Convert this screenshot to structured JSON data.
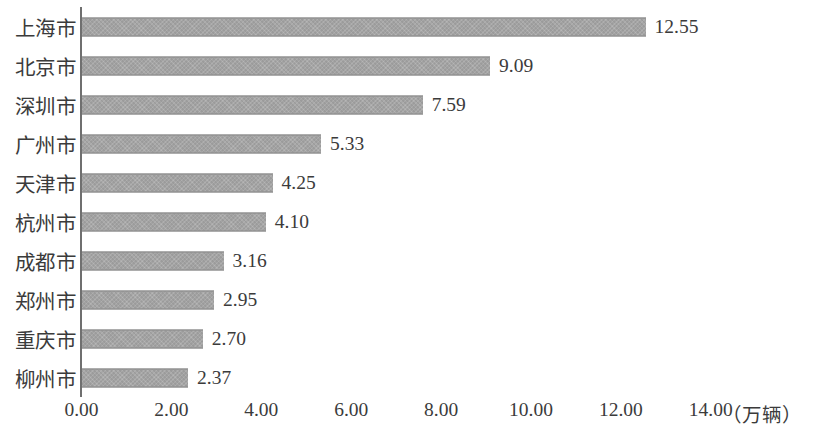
{
  "chart_data": {
    "type": "bar",
    "orientation": "horizontal",
    "title": "",
    "subtitle": "",
    "xlabel": "（万辆）",
    "ylabel": "",
    "categories": [
      "上海市",
      "北京市",
      "深圳市",
      "广州市",
      "天津市",
      "杭州市",
      "成都市",
      "郑州市",
      "重庆市",
      "柳州市"
    ],
    "values": [
      12.55,
      9.09,
      7.59,
      5.33,
      4.25,
      4.1,
      3.16,
      2.95,
      2.7,
      2.37
    ],
    "data_labels": [
      "12.55",
      "9.09",
      "7.59",
      "5.33",
      "4.25",
      "4.10",
      "3.16",
      "2.95",
      "2.70",
      "2.37"
    ],
    "xlim": [
      0,
      14
    ],
    "xticks": [
      0,
      2,
      4,
      6,
      8,
      10,
      12,
      14
    ],
    "xtick_labels": [
      "0.00",
      "2.00",
      "4.00",
      "6.00",
      "8.00",
      "10.00",
      "12.00",
      "14.00"
    ],
    "grid": false,
    "legend": false,
    "bar_color": "#9b9b9b",
    "axis_color": "#6f6f6f",
    "text_color": "#3b3b3b"
  }
}
